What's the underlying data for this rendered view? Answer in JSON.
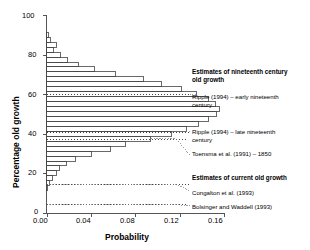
{
  "chart_data": {
    "type": "bar",
    "orientation": "horizontal",
    "title": "",
    "xlabel": "Probability",
    "ylabel": "Percentage old growth",
    "xlim": [
      0.0,
      0.16
    ],
    "ylim": [
      0,
      100
    ],
    "xticks": [
      "0.00",
      "0.04",
      "0.08",
      "0.12",
      "0.16"
    ],
    "xtick_values": [
      0.0,
      0.04,
      0.08,
      0.12,
      0.16
    ],
    "yticks": [
      "0",
      "20",
      "40",
      "60",
      "80",
      "100"
    ],
    "ytick_values": [
      0,
      20,
      40,
      60,
      80,
      100
    ],
    "grid": false,
    "legend": "none",
    "bin_width": 2.5,
    "categories": [
      90.0,
      87.5,
      85.0,
      82.5,
      80.0,
      77.5,
      75.0,
      72.5,
      70.0,
      67.5,
      65.0,
      62.5,
      60.0,
      57.5,
      55.0,
      52.5,
      50.0,
      47.5,
      45.0,
      42.5,
      40.0,
      37.5,
      35.0,
      32.5,
      30.0,
      27.5,
      25.0,
      22.5,
      20.0,
      17.5,
      15.0,
      12.5
    ],
    "values": [
      0.002,
      0.004,
      0.009,
      0.006,
      0.013,
      0.019,
      0.029,
      0.043,
      0.062,
      0.087,
      0.104,
      0.122,
      0.135,
      0.146,
      0.152,
      0.156,
      0.153,
      0.146,
      0.137,
      0.126,
      0.113,
      0.094,
      0.071,
      0.058,
      0.041,
      0.026,
      0.018,
      0.012,
      0.009,
      0.005,
      0.003,
      0.001
    ],
    "reference_lines": [
      {
        "label": "Ripple (1994) – early nineteenth century",
        "y": 60.0,
        "style": "dotted"
      },
      {
        "label": "Ripple (1994) – late nineteenth century",
        "y": 41.0,
        "style": "dotted"
      },
      {
        "label": "Toensma et al. (1991) – 1850",
        "y": 37.5,
        "style": "dotted"
      },
      {
        "label": "Congalton et al. (1993)",
        "y": 14.5,
        "style": "dotted"
      },
      {
        "label": "Bolsinger and Waddell (1993)",
        "y": 4.5,
        "style": "dotted"
      }
    ]
  },
  "annotations": {
    "group_nineteenth": "Estimates of nineteenth century\nold growth",
    "group_current": "Estimates of current old growth",
    "ripple_early": "Ripple (1994) – early nineteenth\ncentury",
    "ripple_late": "Ripple (1994) – late nineteenth\ncentury",
    "toensma": "Toensma et al. (1991) – 1850",
    "congalton": "Congalton et al. (1993)",
    "bolsinger": "Bolsinger and Waddell (1993)"
  },
  "axes": {
    "xlabel": "Probability",
    "ylabel": "Percentage old growth"
  },
  "colors": {
    "axis": "#555555",
    "bar_stroke": "#444444",
    "reference": "#333333",
    "text": "#000000",
    "background": "#ffffff"
  }
}
